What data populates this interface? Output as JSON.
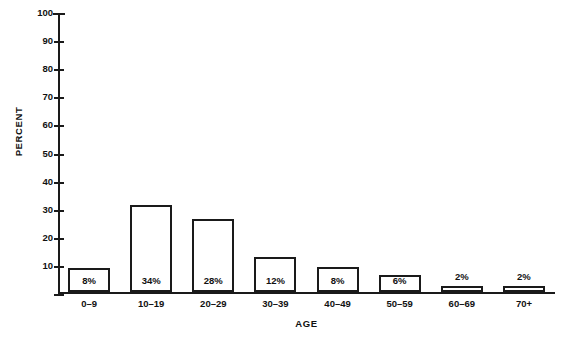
{
  "chart_data": {
    "type": "bar",
    "title": "",
    "xlabel": "AGE",
    "ylabel": "PERCENT",
    "categories": [
      "0–9",
      "10–19",
      "20–29",
      "30–39",
      "40–49",
      "50–59",
      "60–69",
      "70+"
    ],
    "values": [
      8,
      34,
      28,
      12,
      8,
      6,
      2,
      2
    ],
    "bar_heights": [
      8.5,
      31,
      26,
      12.5,
      9,
      6,
      2,
      2
    ],
    "data_labels": [
      "8%",
      "34%",
      "28%",
      "12%",
      "8%",
      "6%",
      "2%",
      "2%"
    ],
    "label_placement": [
      "inside",
      "inside",
      "inside",
      "inside",
      "inside",
      "inside",
      "above",
      "above"
    ],
    "ylim": [
      0,
      100
    ],
    "ytick_values": [
      0,
      10,
      20,
      30,
      40,
      50,
      60,
      70,
      80,
      90,
      100
    ],
    "ytick_labels": [
      "",
      "10",
      "20",
      "30",
      "40",
      "50",
      "60",
      "70",
      "80",
      "90",
      "100"
    ],
    "grid": false,
    "legend": false,
    "bar_fill_color": "#ffffff",
    "bar_edge_color": "#1a1a1a",
    "axis_color": "#1a1a1a",
    "background_color": "#ffffff"
  },
  "caption_sliver": ""
}
